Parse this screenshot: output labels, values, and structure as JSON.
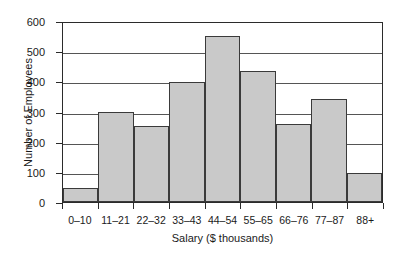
{
  "chart_data": {
    "type": "bar",
    "title": "",
    "xlabel": "Salary ($ thousands)",
    "ylabel": "Number of Employees",
    "categories": [
      "0–10",
      "11–21",
      "22–32",
      "33–43",
      "44–54",
      "55–65",
      "66–76",
      "77–87",
      "88+"
    ],
    "values": [
      46,
      300,
      252,
      397,
      550,
      434,
      258,
      341,
      96
    ],
    "ylim": [
      0,
      600
    ],
    "yticks": [
      0,
      100,
      200,
      300,
      400,
      500,
      600
    ],
    "ytick_labels": [
      "0",
      "100",
      "200",
      "300",
      "400",
      "500",
      "600"
    ],
    "grid": true,
    "legend": false,
    "bar_color": "#c9c9c9",
    "bar_edge_color": "#3a3a3a",
    "axis_color": "#2b2b2b",
    "gridline_color": "#555555",
    "background_color": "#ffffff"
  }
}
